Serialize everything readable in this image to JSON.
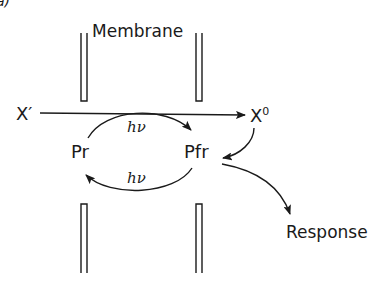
{
  "figure": {
    "panel_mark": "a)",
    "membrane_label": "Membrane",
    "nodes": {
      "x_prime": "X′",
      "x_zero": "X",
      "x_zero_sup": "0",
      "pr": "Pr",
      "pfr": "Pfr",
      "response": "Response"
    },
    "transitions": {
      "upper_light": "hν",
      "lower_light": "hν"
    },
    "colors": {
      "ink": "#1a1a1a",
      "background": "#ffffff"
    }
  }
}
